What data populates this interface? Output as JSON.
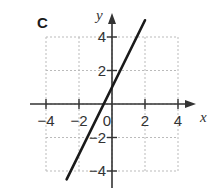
{
  "panel_label": "C",
  "chart_data": {
    "type": "line",
    "title": "",
    "xlabel": "x",
    "ylabel": "y",
    "xlim": [
      -4,
      4
    ],
    "ylim": [
      -4,
      4
    ],
    "grid": true,
    "x_ticks": [
      -4,
      -2,
      0,
      2,
      4
    ],
    "y_ticks": [
      -4,
      -2,
      2,
      4
    ],
    "x_tick_labels": [
      "−4",
      "−2",
      "0",
      "2",
      "4"
    ],
    "y_tick_labels": [
      "−4",
      "−2",
      "2",
      "4"
    ],
    "series": [
      {
        "name": "y = 2x + 1",
        "equation": "y = 2x + 1",
        "slope": 2,
        "intercept": 1,
        "x": [
          -2.75,
          2.0
        ],
        "y": [
          -4.5,
          5.0
        ]
      }
    ]
  },
  "colors": {
    "axis": "#333333",
    "grid": "#bbbbbb",
    "line": "#1a1a1a",
    "text": "#333333"
  }
}
